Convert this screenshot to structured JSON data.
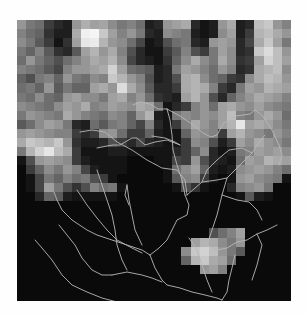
{
  "map": {
    "frame": {
      "x": 17,
      "y": 20,
      "width": 274,
      "height": 281
    },
    "background": "#000000",
    "page_background": "#fefefe",
    "river_color": "#b8b8b8",
    "river_width": 0.9,
    "raster": {
      "cols": 30,
      "rows": 31,
      "values": [
        [
          150,
          120,
          110,
          60,
          40,
          30,
          150,
          175,
          160,
          165,
          140,
          120,
          130,
          110,
          30,
          40,
          150,
          160,
          170,
          40,
          20,
          30,
          150,
          170,
          30,
          40,
          190,
          200,
          150,
          130
        ],
        [
          130,
          110,
          100,
          50,
          30,
          30,
          170,
          240,
          245,
          200,
          160,
          130,
          150,
          120,
          40,
          30,
          140,
          130,
          120,
          30,
          20,
          30,
          140,
          160,
          30,
          60,
          180,
          190,
          170,
          150
        ],
        [
          140,
          120,
          90,
          60,
          20,
          50,
          160,
          230,
          235,
          180,
          150,
          140,
          110,
          70,
          20,
          30,
          80,
          110,
          120,
          40,
          30,
          150,
          160,
          150,
          40,
          70,
          170,
          200,
          160,
          120
        ],
        [
          120,
          100,
          130,
          90,
          50,
          40,
          90,
          160,
          180,
          150,
          170,
          130,
          80,
          40,
          20,
          20,
          60,
          90,
          130,
          80,
          60,
          120,
          160,
          140,
          40,
          50,
          200,
          220,
          190,
          150
        ],
        [
          110,
          150,
          120,
          100,
          80,
          110,
          130,
          150,
          170,
          160,
          180,
          140,
          70,
          40,
          30,
          20,
          50,
          100,
          140,
          170,
          140,
          120,
          170,
          140,
          50,
          60,
          160,
          210,
          190,
          160
        ],
        [
          130,
          120,
          110,
          90,
          70,
          130,
          150,
          150,
          160,
          170,
          210,
          160,
          110,
          100,
          90,
          30,
          40,
          120,
          160,
          150,
          130,
          110,
          150,
          130,
          40,
          50,
          170,
          180,
          190,
          140
        ],
        [
          100,
          80,
          120,
          130,
          100,
          150,
          120,
          110,
          140,
          130,
          200,
          180,
          150,
          130,
          80,
          30,
          40,
          80,
          170,
          180,
          140,
          110,
          100,
          60,
          50,
          140,
          170,
          190,
          180,
          150
        ],
        [
          110,
          120,
          100,
          150,
          90,
          120,
          100,
          100,
          160,
          170,
          150,
          220,
          170,
          140,
          90,
          40,
          40,
          60,
          170,
          180,
          170,
          130,
          60,
          40,
          120,
          160,
          150,
          180,
          170,
          160
        ],
        [
          120,
          110,
          140,
          110,
          100,
          150,
          160,
          140,
          140,
          120,
          160,
          170,
          130,
          150,
          110,
          50,
          40,
          30,
          160,
          180,
          150,
          80,
          40,
          100,
          130,
          150,
          170,
          160,
          150,
          130
        ],
        [
          140,
          130,
          120,
          110,
          140,
          160,
          150,
          170,
          130,
          140,
          160,
          150,
          140,
          170,
          160,
          110,
          20,
          40,
          60,
          130,
          150,
          110,
          160,
          170,
          150,
          140,
          160,
          140,
          130,
          120
        ],
        [
          120,
          150,
          140,
          130,
          120,
          170,
          150,
          130,
          120,
          110,
          140,
          130,
          100,
          150,
          180,
          30,
          20,
          120,
          140,
          130,
          150,
          140,
          160,
          190,
          130,
          120,
          150,
          170,
          150,
          110
        ],
        [
          90,
          110,
          140,
          160,
          150,
          120,
          40,
          30,
          110,
          90,
          120,
          130,
          100,
          70,
          130,
          40,
          20,
          60,
          130,
          170,
          150,
          130,
          160,
          180,
          230,
          160,
          170,
          160,
          140,
          120
        ],
        [
          150,
          160,
          150,
          140,
          130,
          130,
          60,
          40,
          60,
          140,
          150,
          110,
          60,
          60,
          100,
          30,
          20,
          20,
          100,
          150,
          140,
          130,
          60,
          160,
          180,
          150,
          140,
          120,
          150,
          130
        ],
        [
          170,
          200,
          190,
          180,
          200,
          150,
          50,
          30,
          30,
          40,
          80,
          60,
          40,
          70,
          40,
          30,
          20,
          20,
          60,
          140,
          130,
          80,
          30,
          60,
          160,
          140,
          170,
          150,
          140,
          120
        ],
        [
          120,
          180,
          210,
          230,
          190,
          170,
          60,
          20,
          20,
          20,
          30,
          30,
          20,
          20,
          20,
          20,
          20,
          40,
          60,
          100,
          140,
          40,
          20,
          30,
          120,
          130,
          160,
          150,
          160,
          140
        ],
        [
          20,
          80,
          150,
          160,
          150,
          140,
          60,
          30,
          20,
          20,
          20,
          20,
          10,
          10,
          10,
          20,
          20,
          70,
          60,
          150,
          80,
          40,
          30,
          20,
          110,
          160,
          150,
          180,
          170,
          160
        ],
        [
          10,
          60,
          100,
          140,
          120,
          150,
          130,
          70,
          30,
          20,
          20,
          20,
          10,
          10,
          10,
          10,
          20,
          110,
          140,
          160,
          100,
          30,
          20,
          30,
          140,
          150,
          160,
          150,
          130,
          110
        ],
        [
          10,
          20,
          70,
          120,
          100,
          130,
          110,
          120,
          80,
          60,
          20,
          10,
          10,
          10,
          10,
          10,
          20,
          90,
          130,
          140,
          60,
          20,
          10,
          20,
          150,
          160,
          140,
          130,
          120,
          20
        ],
        [
          10,
          20,
          70,
          160,
          120,
          80,
          50,
          80,
          130,
          110,
          120,
          20,
          10,
          10,
          10,
          10,
          10,
          20,
          80,
          50,
          20,
          10,
          10,
          40,
          130,
          140,
          150,
          120,
          10,
          10
        ],
        [
          10,
          10,
          40,
          100,
          90,
          30,
          20,
          20,
          20,
          20,
          20,
          10,
          10,
          10,
          10,
          10,
          10,
          10,
          10,
          10,
          10,
          10,
          10,
          10,
          20,
          90,
          30,
          20,
          10,
          10
        ],
        [
          10,
          10,
          10,
          10,
          10,
          10,
          10,
          10,
          10,
          10,
          10,
          10,
          10,
          10,
          10,
          10,
          10,
          10,
          10,
          10,
          10,
          10,
          10,
          10,
          10,
          10,
          10,
          10,
          10,
          10
        ],
        [
          10,
          10,
          10,
          10,
          10,
          10,
          10,
          10,
          10,
          10,
          10,
          10,
          10,
          10,
          10,
          10,
          10,
          10,
          10,
          10,
          10,
          10,
          10,
          10,
          10,
          10,
          10,
          10,
          10,
          10
        ],
        [
          10,
          10,
          10,
          10,
          10,
          10,
          10,
          10,
          10,
          10,
          10,
          10,
          10,
          10,
          10,
          10,
          10,
          10,
          10,
          10,
          10,
          10,
          10,
          10,
          10,
          10,
          10,
          10,
          10,
          10
        ],
        [
          10,
          10,
          10,
          10,
          10,
          10,
          10,
          10,
          10,
          10,
          10,
          10,
          10,
          10,
          10,
          10,
          10,
          10,
          10,
          10,
          10,
          80,
          110,
          130,
          160,
          10,
          10,
          10,
          10,
          10
        ],
        [
          10,
          10,
          10,
          10,
          10,
          10,
          10,
          10,
          10,
          10,
          10,
          10,
          10,
          10,
          10,
          10,
          10,
          10,
          10,
          160,
          180,
          170,
          140,
          120,
          150,
          10,
          10,
          10,
          10,
          10
        ],
        [
          10,
          10,
          10,
          10,
          10,
          10,
          10,
          10,
          10,
          10,
          10,
          10,
          10,
          10,
          10,
          10,
          10,
          10,
          140,
          200,
          210,
          190,
          150,
          120,
          90,
          10,
          10,
          10,
          10,
          10
        ],
        [
          10,
          10,
          10,
          10,
          10,
          10,
          10,
          10,
          10,
          10,
          10,
          10,
          10,
          10,
          10,
          10,
          10,
          10,
          100,
          180,
          200,
          170,
          160,
          110,
          10,
          10,
          10,
          10,
          10,
          10
        ],
        [
          10,
          10,
          10,
          10,
          10,
          10,
          10,
          10,
          10,
          10,
          10,
          10,
          10,
          10,
          10,
          10,
          10,
          10,
          10,
          10,
          150,
          160,
          130,
          10,
          10,
          10,
          10,
          10,
          10,
          10
        ],
        [
          10,
          10,
          10,
          10,
          10,
          10,
          10,
          10,
          10,
          10,
          10,
          10,
          10,
          10,
          10,
          10,
          10,
          10,
          10,
          10,
          10,
          10,
          10,
          10,
          10,
          10,
          10,
          10,
          10,
          10
        ],
        [
          10,
          10,
          10,
          10,
          10,
          10,
          10,
          10,
          10,
          10,
          10,
          10,
          10,
          10,
          10,
          10,
          10,
          10,
          10,
          10,
          10,
          10,
          10,
          10,
          10,
          10,
          10,
          10,
          10,
          10
        ],
        [
          10,
          10,
          10,
          10,
          10,
          10,
          10,
          10,
          10,
          10,
          10,
          10,
          10,
          10,
          10,
          10,
          10,
          10,
          10,
          10,
          10,
          10,
          10,
          10,
          10,
          10,
          10,
          10,
          10,
          10
        ]
      ]
    },
    "rivers": [
      "163,125 150,120 138,122 128,125 120,118 115,118 103,125 96,125 90,126 80,128",
      "163,125 158,122 148,118 135,116",
      "116,85 123,82 133,84 141,89 150,89",
      "150,89 163,96 175,104 186,113 194,117 200,115 206,104 219,96 233,94 238,90",
      "238,90 245,95 255,110 262,125 265,135 262,145",
      "150,89 153,100 155,115 156,130 160,145 165,160 168,175",
      "63,112 75,110 88,112 100,122 115,130 130,140 145,148 160,150 168,160 170,175",
      "170,175 185,162 200,160 210,158",
      "210,158 205,175 200,195 195,210 190,225",
      "168,175 172,185 170,195 160,200 155,210 150,220 142,228 133,235",
      "133,235 125,230 110,225 95,220 80,215 70,210 55,200 45,190 40,180 37,172",
      "133,235 138,248 145,260 150,265 163,268 175,272 188,275 200,278 205,280",
      "205,280 210,272 212,260 215,248 218,235",
      "190,225 200,230 210,228 220,222 230,220 240,214 250,210 260,205",
      "210,158 220,148 228,140 235,133 240,125 248,115",
      "205,175 220,180 232,182 240,190 245,200",
      "80,150 85,165 90,180 95,195 98,210 100,225 105,240 110,250",
      "60,170 70,185 80,198 90,210 100,220 115,228 125,233",
      "42,205 50,215 58,225 65,238 75,250 85,255 95,255",
      "95,255 110,252 125,255 135,258 145,262",
      "110,165 112,180 115,195 118,210 125,225",
      "110,165 108,175 112,185",
      "172,218 180,230 185,245 190,260 195,272",
      "240,214 245,225 240,245 235,260",
      "18,220 25,228 35,240 45,255 55,265 70,272 85,278 100,282 115,282",
      "185,162 190,150 200,140 212,130 225,128 235,133"
    ]
  }
}
